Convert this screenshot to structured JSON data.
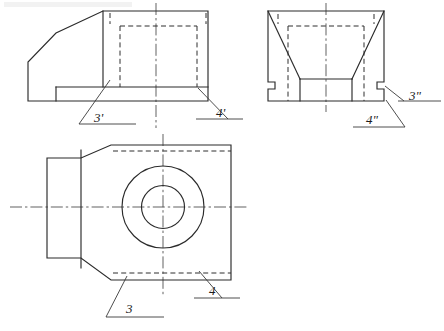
{
  "document": {
    "title": "Orthographic projection exercise — three views of a bracket",
    "header_faint_text": "",
    "background_color": "#ffffff",
    "line_color": "#2b2b2b",
    "hidden_line_color": "#2f2f2f",
    "center_line_color": "#444444"
  },
  "views": {
    "front_view": {
      "name": "front-view",
      "position": "top-left",
      "labels": [
        {
          "id": "label-3-prime",
          "text": "3'",
          "x": 94,
          "y": 122
        },
        {
          "id": "label-4-prime",
          "text": "4'",
          "x": 216,
          "y": 117
        }
      ]
    },
    "side_view": {
      "name": "side-view",
      "position": "top-right",
      "labels": [
        {
          "id": "label-3-double-prime",
          "text": "3\"",
          "x": 410,
          "y": 100
        },
        {
          "id": "label-4-double-prime",
          "text": "4\"",
          "x": 367,
          "y": 123
        }
      ]
    },
    "top_view": {
      "name": "top-view",
      "position": "bottom",
      "labels": [
        {
          "id": "label-3",
          "text": "3",
          "x": 128,
          "y": 312
        },
        {
          "id": "label-4",
          "text": "4",
          "x": 211,
          "y": 294
        }
      ],
      "circles": [
        {
          "id": "outer-circle",
          "cx": 163,
          "cy": 207,
          "r": 41
        },
        {
          "id": "inner-circle",
          "cx": 163,
          "cy": 207,
          "r": 21.5
        }
      ]
    }
  },
  "geometry": {
    "front_view": {
      "outline": "M 28,101 L 28,62 L 56,33 L 103,11 L 208,11 L 208,101 L 28,101 Z",
      "step_top": "M 56,87 L 208,87",
      "step_left": "M 56,87 L 56,101",
      "vertical_edge": "M 103,11 L 103,87",
      "hidden_lines": [
        "M 120,26 L 197,26",
        "M 120,26 L 120,87",
        "M 197,26 L 197,87",
        "M 109,19 L 109,26",
        "M 207,19 L 207,26"
      ],
      "center_line": "M 156,3 L 156,128"
    },
    "side_view": {
      "outline": "M 268,11 L 384,11 L 384,101 L 268,101 Z",
      "chamfer_left": "M 268,11 L 300,79",
      "chamfer_right": "M 384,11 L 352,79",
      "inner_floor": "M 300,79 L 352,79",
      "inner_left_wall": "M 300,79 L 300,101",
      "inner_right_wall": "M 352,79 L 352,101",
      "notch_left": "M 268,82 L 275,82 L 275,89 L 268,89",
      "notch_right": "M 384,82 L 377,82 L 377,89 L 384,89",
      "hidden_lines": [
        "M 288,26 L 364,26",
        "M 288,26 L 288,101",
        "M 364,26 L 364,101",
        "M 278,19 L 278,26",
        "M 374,19 L 374,26"
      ],
      "center_line": "M 326,3 L 326,112"
    },
    "top_view": {
      "outline": "M 231,145 L 231,280 L 111,280 L 81,258 L 47,258 L 47,158 L 81,158 L 111,145 Z",
      "vertical_edge": "M 81,152 L 81,268",
      "hidden_top": "M 111,151 L 231,151",
      "hidden_bottom": "M 111,273 L 231,273",
      "center_line_h": "M 10,207 L 248,207",
      "center_line_v": "M 163,134 L 163,297"
    }
  },
  "leaders": {
    "front_3_prime": {
      "line": "M 110,80 L 79,124",
      "underline": "M 79,124 L 136,124"
    },
    "front_4_prime": {
      "line": "M 198,88 L 228,119",
      "underline": "M 196,119 L 243,119"
    },
    "side_3_double": {
      "line": "M 385,86 L 403,101",
      "underline": "M 398,101 L 441,101"
    },
    "side_4_double": {
      "line": "M 385,100 L 404,126",
      "underline": "M 352,126 L 404,126"
    },
    "top_3": {
      "line": "M 127,276 L 106,317",
      "underline": "M 106,317 L 164,317"
    },
    "top_4": {
      "line": "M 199,271 L 222,298",
      "underline": "M 194,298 L 240,298"
    }
  }
}
